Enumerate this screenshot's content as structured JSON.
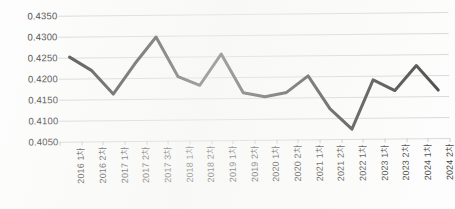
{
  "chart_data": {
    "type": "line",
    "title": "",
    "subtitle": "",
    "xlabel": "",
    "ylabel": "",
    "ylim": [
      0.405,
      0.435
    ],
    "ytick_step": 0.005,
    "ytick_labels": [
      "0.4350",
      "0.4300",
      "0.4250",
      "0.4200",
      "0.4150",
      "0.4100",
      "0.4050"
    ],
    "ytick_values": [
      0.435,
      0.43,
      0.425,
      0.42,
      0.415,
      0.41,
      0.405
    ],
    "grid": true,
    "grid_axis": "y",
    "legend": false,
    "legend_position": "none",
    "markers": false,
    "line_color": "#404040",
    "line_width": 3,
    "grid_color": "#d7d7d7",
    "categories": [
      "2016 1차",
      "2016 2차",
      "2017 1차",
      "2017 2차",
      "2017 3차",
      "2018 1차",
      "2018 2차",
      "2019 1차",
      "2019 2차",
      "2020 1차",
      "2020 2차",
      "2021 1차",
      "2021 2차",
      "2022 1차",
      "2023 1차",
      "2023 2차",
      "2024 1차",
      "2024 2차"
    ],
    "values": [
      0.4251,
      0.4219,
      0.4162,
      0.4233,
      0.4297,
      0.4202,
      0.4181,
      0.4255,
      0.4162,
      0.4152,
      0.4162,
      0.4201,
      0.4122,
      0.4073,
      0.419,
      0.4164,
      0.4223,
      0.4164
    ],
    "series": [
      {
        "name": "",
        "values": [
          0.4251,
          0.4219,
          0.4162,
          0.4233,
          0.4297,
          0.4202,
          0.4181,
          0.4255,
          0.4162,
          0.4152,
          0.4162,
          0.4201,
          0.4122,
          0.4073,
          0.419,
          0.4164,
          0.4223,
          0.4164
        ]
      }
    ]
  }
}
